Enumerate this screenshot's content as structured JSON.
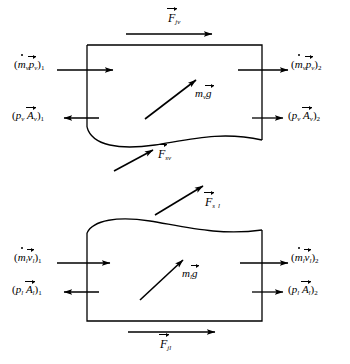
{
  "diagram": {
    "stroke_color": "#000000",
    "background_color": "#ffffff",
    "panels": [
      {
        "name": "vapor-control-volume",
        "phase_subscript": "v",
        "boundary": "straight top, left and right edges with wavy bottom interface",
        "body_force": {
          "symbol": "m",
          "phase": "v",
          "field": "g",
          "text": "m_v g"
        },
        "top_force": {
          "symbol": "F",
          "subscript": "j v",
          "text": "F_jv"
        },
        "interface_force": {
          "symbol": "F",
          "subscript": "s v",
          "text": "F_sv"
        },
        "inlet_momentum": {
          "text": "(m_v p_v)_1",
          "station": "1"
        },
        "outlet_momentum": {
          "text": "(m_v p_v)_2",
          "station": "2"
        },
        "inlet_pressure": {
          "text": "(p_v A_v)_1",
          "station": "1"
        },
        "outlet_pressure": {
          "text": "(p_v A_v)_2",
          "station": "2"
        }
      },
      {
        "name": "liquid-control-volume",
        "phase_subscript": "l",
        "boundary": "wavy top interface with straight left, right and bottom edges",
        "body_force": {
          "symbol": "m",
          "phase": "l",
          "field": "g",
          "text": "m_l g"
        },
        "top_force": {
          "symbol": "F",
          "subscript": "s l",
          "text": "F_sl"
        },
        "bottom_force": {
          "symbol": "F",
          "subscript": "j l",
          "text": "F_jl"
        },
        "inlet_momentum": {
          "text": "(m_l v_l)_1",
          "station": "1"
        },
        "outlet_momentum": {
          "text": "(m_l v_l)_2",
          "station": "2"
        },
        "inlet_pressure": {
          "text": "(p_l A_l)_1",
          "station": "1"
        },
        "outlet_pressure": {
          "text": "(p_l A_l)_2",
          "station": "2"
        }
      }
    ],
    "symbols": {
      "F": "F",
      "m": "m",
      "p": "p",
      "v": "v",
      "A": "A",
      "g": "g",
      "sub_v": "v",
      "sub_l": "l",
      "sub_j": "j",
      "sub_s": "s",
      "sub_1": "1",
      "sub_2": "2"
    }
  }
}
